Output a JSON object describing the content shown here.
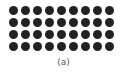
{
  "figure": {
    "caption": "(a)",
    "dot_grid": {
      "rows": 4,
      "columns": 9,
      "dot_color": "#222222"
    }
  }
}
